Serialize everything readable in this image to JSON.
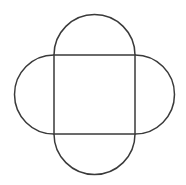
{
  "diagram": {
    "stroke_color": "#3a3a3a",
    "fill_color": "none",
    "background_color": "#ffffff",
    "square": {
      "x": 54,
      "y": 55,
      "width": 81,
      "height": 79
    },
    "semicircles": [
      {
        "side": "top",
        "radius": 40.5
      },
      {
        "side": "right",
        "radius": 39.5
      },
      {
        "side": "bottom",
        "radius": 40.5
      },
      {
        "side": "left",
        "radius": 39.5
      }
    ]
  }
}
